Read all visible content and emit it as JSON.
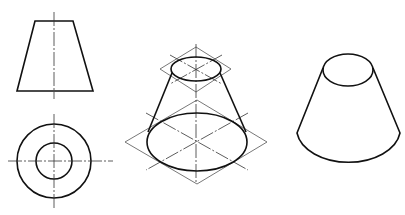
{
  "figure": {
    "caption_partial": "图 — 圆台视图",
    "views": [
      {
        "id": "front-view",
        "shape": "trapezoid",
        "description": "Front view of frustum"
      },
      {
        "id": "top-view",
        "shape": "concentric-circles",
        "description": "Top view of frustum"
      },
      {
        "id": "isometric-construction",
        "shape": "ellipses-in-rhombi",
        "description": "Isometric construction of frustum"
      },
      {
        "id": "isometric-result",
        "shape": "frustum",
        "description": "Finished isometric frustum"
      }
    ],
    "colors": {
      "line": "#111111",
      "construction": "#555555",
      "background": "#ffffff"
    }
  }
}
